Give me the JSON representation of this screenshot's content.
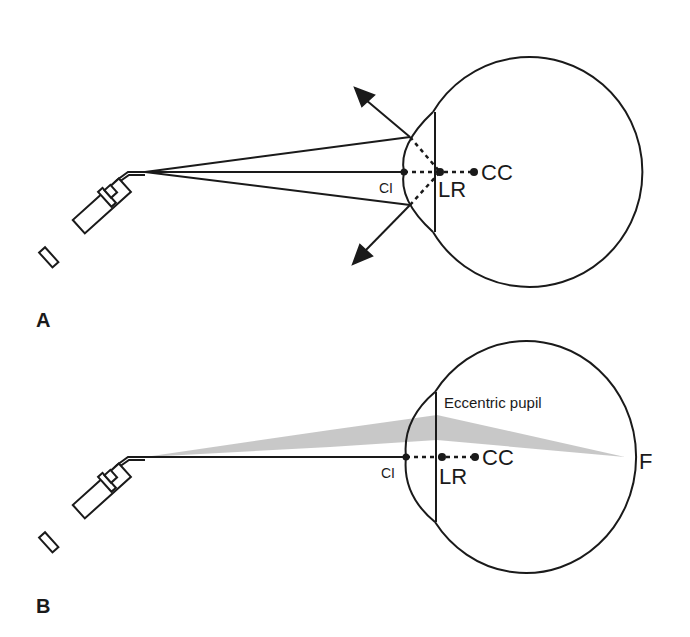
{
  "panels": [
    {
      "id": "A",
      "label": "A",
      "points": {
        "ci": "CI",
        "lr": "LR",
        "cc": "CC"
      }
    },
    {
      "id": "B",
      "label": "B",
      "points": {
        "ci": "CI",
        "lr": "LR",
        "cc": "CC",
        "f": "F"
      },
      "annotation": "Eccentric pupil"
    }
  ],
  "colors": {
    "stroke": "#1a1a1a",
    "beam": "#bdbdbd",
    "background": "#ffffff"
  }
}
